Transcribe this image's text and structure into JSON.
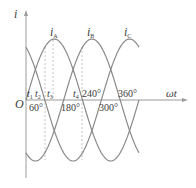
{
  "diagram": {
    "axes": {
      "y_label": "i",
      "x_label": "ωt",
      "origin_label": "O"
    },
    "curves": [
      {
        "name": "i",
        "sub": "A",
        "phase_deg": 0
      },
      {
        "name": "i",
        "sub": "B",
        "phase_deg": -120
      },
      {
        "name": "i",
        "sub": "C",
        "phase_deg": 120
      }
    ],
    "time_marks": [
      {
        "label": "t",
        "sub": "1"
      },
      {
        "label": "t",
        "sub": "2"
      },
      {
        "label": "t",
        "sub": "3"
      },
      {
        "label": "t",
        "sub": "4"
      }
    ],
    "angle_marks_above": [
      "240°",
      "360°"
    ],
    "angle_marks_below": [
      "60°",
      "180°",
      "300°"
    ],
    "colors": {
      "curve": "#8a8a8a",
      "axis": "#9a9a9a",
      "dashed": "#bdbdbd",
      "text": "#3a3a3a"
    }
  }
}
